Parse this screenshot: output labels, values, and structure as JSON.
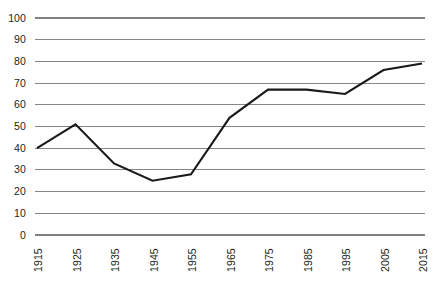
{
  "chart_data": {
    "type": "line",
    "title": "",
    "subtitle": "",
    "xlabel": "",
    "ylabel": "",
    "categories": [
      "1915",
      "1925",
      "1935",
      "1945",
      "1955",
      "1965",
      "1975",
      "1985",
      "1995",
      "2005",
      "2015"
    ],
    "x": [
      1915,
      1925,
      1935,
      1945,
      1955,
      1965,
      1975,
      1985,
      1995,
      2005,
      2015
    ],
    "values": [
      40,
      51,
      33,
      25,
      28,
      54,
      67,
      67,
      65,
      76,
      79
    ],
    "series": [
      {
        "name": "",
        "values": [
          40,
          51,
          33,
          25,
          28,
          54,
          67,
          67,
          65,
          76,
          79
        ],
        "color": "#1a1a1a"
      }
    ],
    "ylim": [
      0,
      100
    ],
    "yticks": [
      0,
      10,
      20,
      30,
      40,
      50,
      60,
      70,
      80,
      90,
      100
    ],
    "ytick_labels": [
      "0",
      "10",
      "20",
      "30",
      "40",
      "50",
      "60",
      "70",
      "80",
      "90",
      "100"
    ],
    "xtick_labels": [
      "1915",
      "1925",
      "1935",
      "1945",
      "1955",
      "1965",
      "1975",
      "1985",
      "1995",
      "2005",
      "2015"
    ],
    "grid": true,
    "grid_axis": "y",
    "grid_color": "#808080",
    "legend": false,
    "legend_position": "none",
    "line_color": "#1a1a1a",
    "line_width": 2.1,
    "markers": false,
    "background_color": "#ffffff",
    "text_color": "#231f20",
    "annotations": []
  }
}
